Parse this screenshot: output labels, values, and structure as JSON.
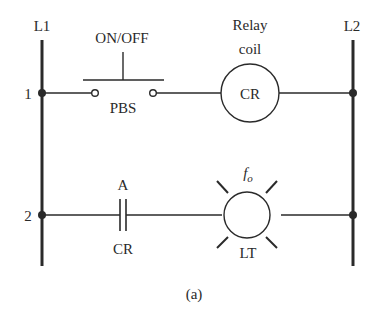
{
  "diagram": {
    "type": "ladder-logic",
    "caption": "(a)",
    "rails": {
      "left": "L1",
      "right": "L2"
    },
    "rungs": [
      {
        "number": "1",
        "elements": [
          {
            "kind": "normally-open pushbutton",
            "top_label": "ON/OFF",
            "bottom_label": "PBS"
          },
          {
            "kind": "relay coil",
            "top_label_line1": "Relay",
            "top_label_line2": "coil",
            "inner_label": "CR"
          }
        ]
      },
      {
        "number": "2",
        "elements": [
          {
            "kind": "normally-open contact",
            "top_label": "A",
            "bottom_label": "CR"
          },
          {
            "kind": "indicator lamp",
            "top_label": "f",
            "top_label_sub": "o",
            "bottom_label": "LT"
          }
        ]
      }
    ]
  },
  "colors": {
    "line": "#2a2a2a",
    "background": "#ffffff"
  }
}
